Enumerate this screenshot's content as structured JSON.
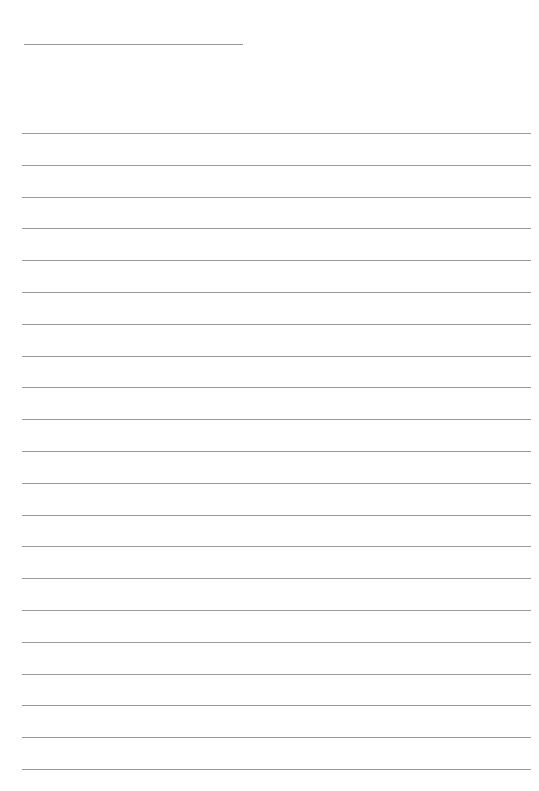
{
  "page": {
    "type": "blank-lined-paper",
    "background": "#ffffff",
    "line_color": "#9a9a9a",
    "header_line": {
      "x": 24,
      "y": 44,
      "width": 219
    },
    "rules": {
      "count": 21,
      "x": 22,
      "width": 509,
      "first_y": 133,
      "spacing": 31.8
    }
  }
}
